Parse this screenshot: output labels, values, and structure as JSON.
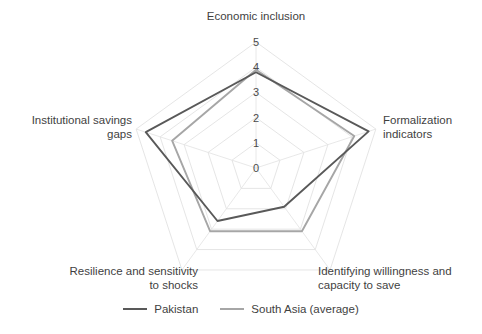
{
  "chart_data": {
    "type": "radar",
    "title": "",
    "categories": [
      "Economic inclusion",
      "Formalization indicators",
      "Identifying willingness and capacity to save",
      "Resilience and sensitivity to shocks",
      "Institutional savings gaps"
    ],
    "category_labels_multiline": [
      "Economic inclusion",
      "Formalization\nindicators",
      "Identifying willingness and\ncapacity to save",
      "Resilience and sensitivity\nto shocks",
      "Institutional savings\ngaps"
    ],
    "tick_labels": [
      "0",
      "1",
      "2",
      "3",
      "4",
      "5"
    ],
    "rlim": [
      0,
      5
    ],
    "grid": true,
    "legend_position": "bottom",
    "series": [
      {
        "name": "Pakistan",
        "color": "#595959",
        "values": [
          3.8,
          4.7,
          1.9,
          2.6,
          4.6
        ]
      },
      {
        "name": "South Asia (average)",
        "color": "#a6a6a6",
        "values": [
          3.9,
          4.1,
          3.1,
          3.1,
          3.5
        ]
      }
    ],
    "xlabel": "",
    "ylabel": ""
  },
  "axis": {
    "ticks": [
      {
        "label": "5"
      },
      {
        "label": "4"
      },
      {
        "label": "3"
      },
      {
        "label": "2"
      },
      {
        "label": "1"
      },
      {
        "label": "0"
      }
    ]
  },
  "labels": {
    "economic_inclusion": "Economic inclusion",
    "formalization_indicators": "Formalization\nindicators",
    "willingness_capacity": "Identifying willingness and\ncapacity to save",
    "resilience_shocks": "Resilience and sensitivity\nto shocks",
    "institutional_savings": "Institutional savings\ngaps"
  },
  "legend": {
    "items": [
      {
        "label": "Pakistan",
        "color": "#595959"
      },
      {
        "label": "South Asia (average)",
        "color": "#a6a6a6"
      }
    ]
  },
  "colors": {
    "pakistan": "#595959",
    "south_asia": "#a6a6a6",
    "grid": "#e2e2e2",
    "text": "#3f3f3f"
  }
}
